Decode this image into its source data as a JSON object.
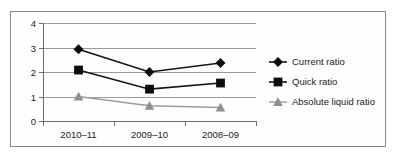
{
  "chart_data": {
    "type": "line",
    "title": "",
    "xlabel": "",
    "ylabel": "",
    "categories": [
      "2010–11",
      "2009–10",
      "2008–09"
    ],
    "ylim": [
      0,
      4
    ],
    "yticks": [
      "0",
      "1",
      "2",
      "3",
      "4"
    ],
    "grid": true,
    "legend_position": "right",
    "series": [
      {
        "name": "Current ratio",
        "marker": "diamond",
        "color": "#0d0d0d",
        "values": [
          2.93,
          2.0,
          2.37
        ]
      },
      {
        "name": "Quick ratio",
        "marker": "square",
        "color": "#0d0d0d",
        "values": [
          2.08,
          1.3,
          1.55
        ]
      },
      {
        "name": "Absolute liquid ratio",
        "marker": "triangle",
        "color": "#8f8f8f",
        "values": [
          1.0,
          0.62,
          0.55
        ]
      }
    ]
  },
  "legend": {
    "items": [
      {
        "label": "Current ratio"
      },
      {
        "label": "Quick ratio"
      },
      {
        "label": "Absolute liquid ratio"
      }
    ]
  },
  "axes": {
    "y_tick_labels": [
      "4",
      "3",
      "2",
      "1",
      "0"
    ],
    "x_tick_labels": [
      "2010–11",
      "2009–10",
      "2008–09"
    ]
  }
}
